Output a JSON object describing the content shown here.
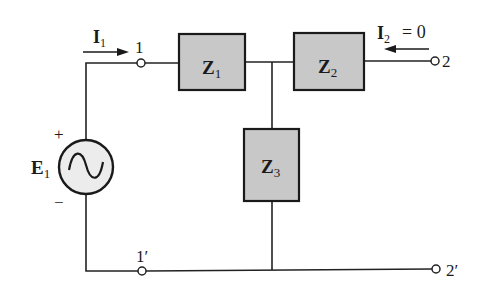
{
  "diagram": {
    "type": "two-port network (T-network) circuit",
    "colors": {
      "wire": "#222222",
      "box_fill": "#c8c8c8",
      "box_stroke": "#1a1a1a",
      "source_fill": "#ececec",
      "background": "#ffffff"
    },
    "source": {
      "symbol": "E",
      "subscript": "1",
      "plus": "+",
      "minus": "−",
      "icon": "ac-sine-source-icon"
    },
    "currents": {
      "i1": {
        "symbol": "I",
        "subscript": "1"
      },
      "i2": {
        "symbol": "I",
        "subscript": "2",
        "equals": "= 0"
      }
    },
    "impedances": [
      {
        "symbol": "Z",
        "subscript": "1"
      },
      {
        "symbol": "Z",
        "subscript": "2"
      },
      {
        "symbol": "Z",
        "subscript": "3"
      }
    ],
    "terminals": {
      "t1": "1",
      "t1p": "1′",
      "t2": "2",
      "t2p": "2′"
    }
  }
}
